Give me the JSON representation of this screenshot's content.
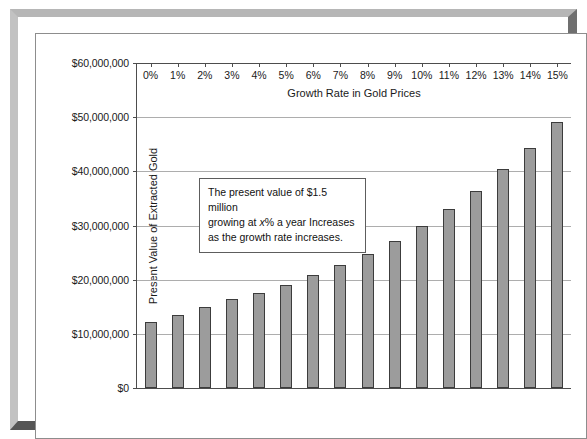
{
  "chart_data": {
    "type": "bar",
    "title": "",
    "xlabel": "Growth Rate in Gold Prices",
    "ylabel": "Present Value of Extracted Gold",
    "categories": [
      "0%",
      "1%",
      "2%",
      "3%",
      "4%",
      "5%",
      "6%",
      "7%",
      "8%",
      "9%",
      "10%",
      "11%",
      "12%",
      "13%",
      "14%",
      "15%"
    ],
    "values": [
      12200000,
      13500000,
      14900000,
      16400000,
      17600000,
      19100000,
      20900000,
      22700000,
      24700000,
      27200000,
      29900000,
      33100000,
      36400000,
      40400000,
      44300000,
      49200000
    ],
    "ylim": [
      0,
      60000000
    ],
    "ytick_values": [
      0,
      10000000,
      20000000,
      30000000,
      40000000,
      50000000,
      60000000
    ],
    "ytick_labels": [
      "$0",
      "$10,000,000",
      "$20,000,000",
      "$30,000,000",
      "$40,000,000",
      "$50,000,000",
      "$60,000,000"
    ],
    "grid": true,
    "legend": "none",
    "bar_color": "#9c9c9c",
    "bar_edge_color": "#3c3c3c",
    "gridline_color": "#adadad",
    "axis_color": "#4d4d4d",
    "annotations": [
      {
        "line1": "The present value of $1.5 million",
        "line2_pre": "growing at ",
        "line2_italic": "x",
        "line2_post": "% a year Increases",
        "line3": "as the growth rate increases."
      }
    ]
  },
  "frame": {
    "border_light": "#bcbcbc",
    "border_shadow": "#555555"
  }
}
